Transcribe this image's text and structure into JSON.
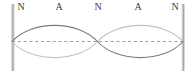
{
  "figure": {
    "background_color": "#ffffff"
  },
  "walls": {
    "color": "#a8a8a8",
    "highlight_color": "#d6d6d6",
    "left_x": 12,
    "right_x": 183,
    "top_y": 4,
    "bottom_y": 71,
    "width": 3
  },
  "axis": {
    "name": "equilibrium-line",
    "style": "dashed",
    "color": "#8a8a8a",
    "y": 41.5,
    "x_start": 12,
    "x_end": 183
  },
  "labels": [
    {
      "id": "label-node-left",
      "text": "N",
      "x": 14,
      "kind": "node"
    },
    {
      "id": "label-antinode-left",
      "text": "A",
      "x": 52,
      "kind": "antinode"
    },
    {
      "id": "label-node-middle",
      "text": "N",
      "x": 91,
      "kind": "node"
    },
    {
      "id": "label-antinode-right",
      "text": "A",
      "x": 131,
      "kind": "antinode"
    },
    {
      "id": "label-node-right",
      "text": "N",
      "x": 168,
      "kind": "node"
    }
  ],
  "chart_data": {
    "type": "line",
    "xlabel": "",
    "ylabel": "",
    "xlim": [
      12,
      183
    ],
    "ylim": [
      20,
      63
    ],
    "grid": false,
    "legend": "none",
    "nodes_x": [
      12,
      97.5,
      183
    ],
    "antinodes_x": [
      54.75,
      140.25
    ],
    "equilibrium_y": 41.5,
    "amplitude_px": 21.5,
    "wavelength_px": 171,
    "harmonic": 2,
    "series": [
      {
        "name": "wave-phase-a",
        "color": "#7b7b7b",
        "linewidth": 1.1,
        "description": "crest on left loop, trough on right loop",
        "path": "M 12 41.5 C 31 20 78 20 97.5 41.5 C 117 63 164 63 183 41.5"
      },
      {
        "name": "wave-phase-b",
        "color": "#c0c0c0",
        "linewidth": 1.1,
        "description": "trough on left loop, crest on right loop",
        "path": "M 12 41.5 C 31 63 78 63 97.5 41.5 C 117 20 164 20 183 41.5"
      }
    ]
  }
}
